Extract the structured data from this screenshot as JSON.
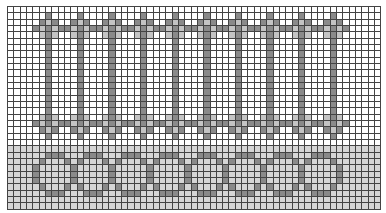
{
  "chart": {
    "type": "knitting-chart",
    "columns": 59,
    "rows": 32,
    "colors": {
      "empty": "#ffffff",
      "background_band": "#d6d6d6",
      "dark": "#8a8a8a",
      "light": "#c4c4c4",
      "gridline": "#444444"
    },
    "top_section": {
      "rows": [
        0,
        21
      ],
      "motif_columns": [
        6,
        11,
        16,
        21,
        26,
        31,
        36,
        41,
        46,
        51
      ],
      "motif": "mirrored cross bars joined by vertical stems"
    },
    "bottom_section": {
      "rows": [
        22,
        31
      ],
      "circle_wall_columns": [
        4,
        10,
        16,
        22,
        28,
        34,
        40,
        46,
        52
      ],
      "circle_rows": [
        23,
        29
      ],
      "circle_count": 8
    }
  }
}
